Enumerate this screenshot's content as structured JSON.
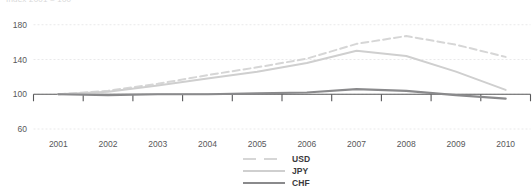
{
  "clipped_header_text": "Index 2001 = 100",
  "chart_data": {
    "type": "line",
    "title": "",
    "subtitle": "",
    "xlabel": "",
    "ylabel": "",
    "x": [
      2001,
      2002,
      2003,
      2004,
      2005,
      2006,
      2007,
      2008,
      2009,
      2010
    ],
    "categories": [
      "2001",
      "2002",
      "2003",
      "2004",
      "2005",
      "2006",
      "2007",
      "2008",
      "2009",
      "2010"
    ],
    "ylim": [
      60,
      220
    ],
    "xlim": [
      2001,
      2010
    ],
    "yticks": [
      60,
      100,
      140,
      180,
      220
    ],
    "ytick_labels": [
      "60",
      "100",
      "140",
      "180",
      "220"
    ],
    "grid": true,
    "legend_position": "bottom-center",
    "series": [
      {
        "name": "USD",
        "style": "dashed",
        "color": "#d6d6d6",
        "values": [
          100,
          104,
          112,
          122,
          131,
          141,
          158,
          167,
          157,
          143
        ]
      },
      {
        "name": "JPY",
        "style": "solid",
        "color": "#cfcfcf",
        "values": [
          100,
          103,
          110,
          118,
          126,
          136,
          150,
          144,
          126,
          105
        ]
      },
      {
        "name": "CHF",
        "style": "solid",
        "color": "#8a8a8c",
        "values": [
          100,
          99,
          100,
          100,
          101,
          102,
          106,
          104,
          99,
          95
        ]
      }
    ]
  },
  "legend": {
    "items": [
      {
        "label": "USD"
      },
      {
        "label": "JPY"
      },
      {
        "label": "CHF"
      }
    ]
  }
}
